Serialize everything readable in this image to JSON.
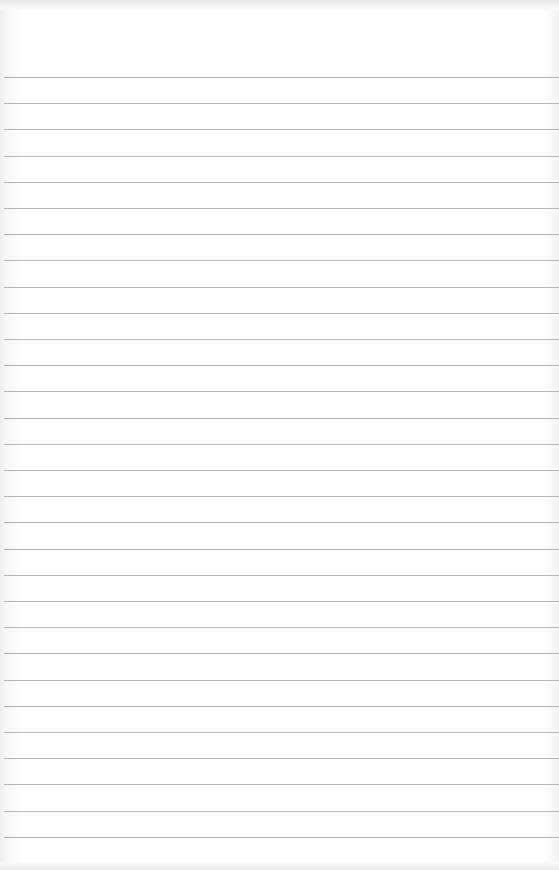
{
  "page": {
    "type": "lined-paper",
    "background_color": "#fefefe",
    "rule_color": "#a9a9a9",
    "rule_count": 30,
    "first_rule_y": 77,
    "rule_spacing": 26.2
  }
}
